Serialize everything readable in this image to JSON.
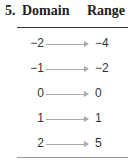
{
  "problem": {
    "number": "5.",
    "domain_header": "Domain",
    "range_header": "Range"
  },
  "mapping": [
    {
      "domain": "−2",
      "range": "−4"
    },
    {
      "domain": "−1",
      "range": "−2"
    },
    {
      "domain": "0",
      "range": "0"
    },
    {
      "domain": "1",
      "range": "1"
    },
    {
      "domain": "2",
      "range": "5"
    }
  ]
}
